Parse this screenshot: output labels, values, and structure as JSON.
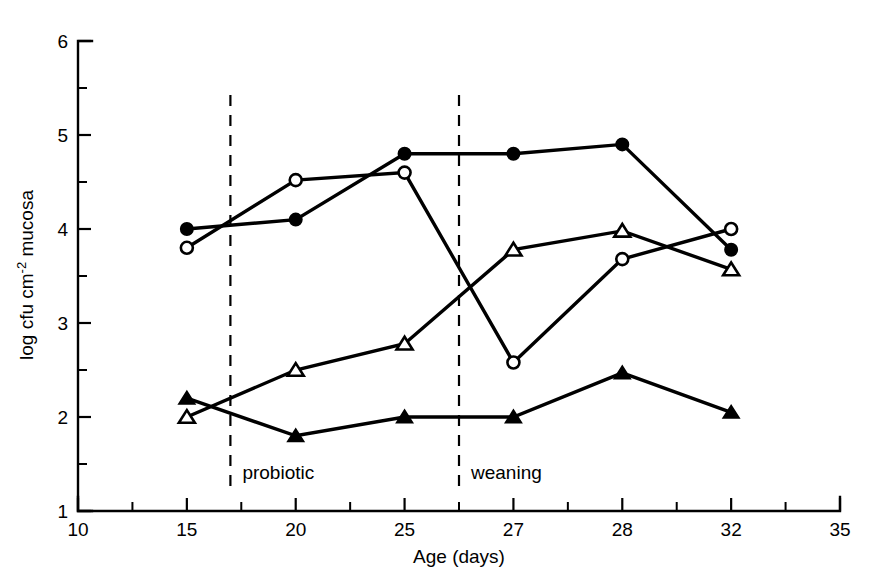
{
  "chart_data": {
    "type": "line",
    "title": "",
    "xlabel": "Age (days)",
    "ylabel": "log cfu cm-2 mucosa",
    "ylabel_parts": {
      "pre": "log cfu cm",
      "sup": "-2",
      "post": " mucosa"
    },
    "x": [
      15,
      20,
      25,
      27,
      28,
      32
    ],
    "x_tick_labels": [
      "10",
      "15",
      "20",
      "25",
      "27",
      "28",
      "32",
      "35"
    ],
    "x_tick_values": [
      10,
      15,
      20,
      25,
      27,
      28,
      32,
      35
    ],
    "y_tick_labels": [
      "1",
      "2",
      "3",
      "4",
      "5",
      "6"
    ],
    "y_tick_values": [
      1,
      2,
      3,
      4,
      5,
      6
    ],
    "y_minor_ticks": [
      1.5,
      2.5,
      3.5,
      4.5,
      5.5
    ],
    "ylim": [
      1,
      6
    ],
    "grid": false,
    "legend": "none",
    "series": [
      {
        "name": "filled-circle",
        "marker": "filled-circle",
        "values": [
          4.0,
          4.1,
          4.8,
          4.8,
          4.9,
          3.78
        ]
      },
      {
        "name": "open-circle",
        "marker": "open-circle",
        "values": [
          3.8,
          4.52,
          4.6,
          2.58,
          3.68,
          4.0
        ]
      },
      {
        "name": "open-triangle",
        "marker": "open-triangle",
        "values": [
          2.0,
          2.5,
          2.78,
          3.78,
          3.98,
          3.57
        ]
      },
      {
        "name": "filled-triangle",
        "marker": "filled-triangle",
        "values": [
          2.2,
          1.8,
          2.0,
          2.0,
          2.47,
          2.05
        ]
      }
    ],
    "annotations": [
      {
        "label": "probiotic",
        "x_value": 17,
        "kind": "vline-dashed"
      },
      {
        "label": "weaning",
        "x_value": 26,
        "kind": "vline-dashed"
      }
    ],
    "colors": {
      "axis": "#000000",
      "line": "#000000",
      "marker_fill_open": "#ffffff",
      "background": "#ffffff"
    }
  }
}
